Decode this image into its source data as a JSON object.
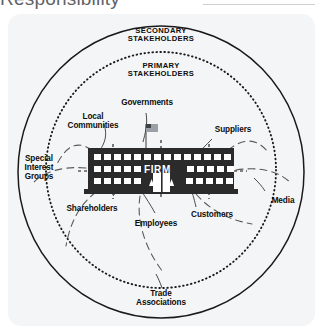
{
  "page": {
    "heading": "Responsibility",
    "background_color": "#ffffff",
    "panel_color": "#f4f5f6"
  },
  "diagram": {
    "type": "concentric-stakeholder-diagram",
    "center": {
      "label": "FIRM",
      "icon": "office-building-icon",
      "color": "#2b2b2b",
      "text_color": "#ffffff"
    },
    "rings": [
      {
        "id": "secondary",
        "label": "SECONDARY\nSTAKEHOLDERS",
        "line_style": "solid",
        "color": "#111111"
      },
      {
        "id": "primary",
        "label": "PRIMARY\nSTAKEHOLDERS",
        "line_style": "dotted",
        "color": "#111111"
      }
    ],
    "primary_stakeholders": [
      {
        "label": "Governments"
      },
      {
        "label": "Suppliers"
      },
      {
        "label": "Customers"
      },
      {
        "label": "Employees"
      },
      {
        "label": "Shareholders"
      },
      {
        "label": "Local\nCommunities"
      }
    ],
    "secondary_stakeholders": [
      {
        "label": "Special\nInterest\nGroups"
      },
      {
        "label": "Media"
      },
      {
        "label": "Trade\nAssociations"
      }
    ],
    "accents": {
      "flag_icon": "united-states-flag-icon",
      "connector_color": "#555555"
    }
  }
}
